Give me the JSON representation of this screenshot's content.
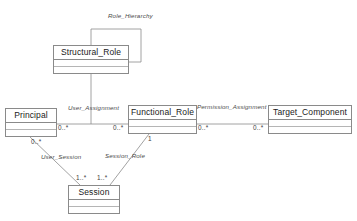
{
  "diagram": {
    "type": "uml-class-diagram",
    "title": "",
    "classes": [
      {
        "id": "structural_role",
        "name": "Structural_Role",
        "x": 53,
        "y": 45,
        "w": 76,
        "h": 29
      },
      {
        "id": "principal",
        "name": "Principal",
        "x": 5,
        "y": 108,
        "w": 52,
        "h": 29
      },
      {
        "id": "functional_role",
        "name": "Functional_Role",
        "x": 128,
        "y": 105,
        "w": 69,
        "h": 29
      },
      {
        "id": "target_component",
        "name": "Target_Component",
        "x": 268,
        "y": 105,
        "w": 84,
        "h": 29
      },
      {
        "id": "session",
        "name": "Session",
        "x": 68,
        "y": 185,
        "w": 52,
        "h": 29
      }
    ],
    "associations": [
      {
        "id": "role_hierarchy",
        "label": "Role_Hierarchy",
        "from": "structural_role",
        "to": "structural_role"
      },
      {
        "id": "user_assignment",
        "label": "User_Assignment",
        "from": "principal",
        "to": "functional_role"
      },
      {
        "id": "permission_assignment",
        "label": "Permission_Assignment",
        "from": "functional_role",
        "to": "target_component"
      },
      {
        "id": "user_session",
        "label": "User_Session",
        "from": "principal",
        "to": "session"
      },
      {
        "id": "session_role",
        "label": "Session_Role",
        "from": "session",
        "to": "functional_role"
      }
    ],
    "multiplicities": [
      {
        "id": "principal_ua",
        "value": "0..*"
      },
      {
        "id": "functional_ua",
        "value": "0..*"
      },
      {
        "id": "functional_pa",
        "value": "0..*"
      },
      {
        "id": "target_pa",
        "value": "0..*"
      },
      {
        "id": "principal_us",
        "value": "0..*"
      },
      {
        "id": "session_us",
        "value": "1..*"
      },
      {
        "id": "session_sr",
        "value": "1..*"
      },
      {
        "id": "functional_sr",
        "value": "1"
      }
    ],
    "colors": {
      "line": "#8a8a8a",
      "box_border": "#8a8a8a",
      "text": "#1a1a1a",
      "label_text": "#4a4a4a",
      "background": "#ffffff"
    }
  }
}
